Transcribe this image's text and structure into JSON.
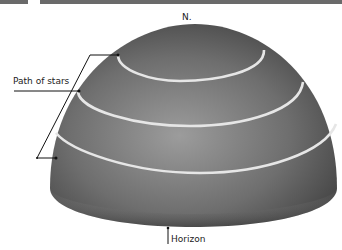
{
  "diagram": {
    "labels": {
      "north": "N.",
      "path_of_stars": "Path of stars",
      "horizon": "Horizon"
    },
    "colors": {
      "dome_dark": "#3e3e3e",
      "dome_mid": "#7a7a7a",
      "dome_light": "#9a9a9a",
      "star_path": "#e6e6e6",
      "leader_line": "#111111",
      "top_bar": "#6a6a6a"
    },
    "star_paths_count": 3
  }
}
